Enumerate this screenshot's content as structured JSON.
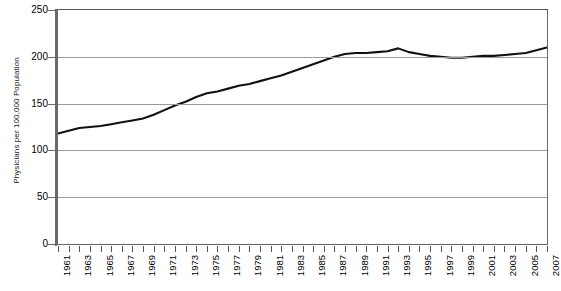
{
  "chart_data": {
    "type": "line",
    "title": "",
    "xlabel": "",
    "ylabel": "Physicians per 100,000 Population",
    "ylim": [
      0,
      250
    ],
    "yticks": [
      0,
      50,
      100,
      150,
      200,
      250
    ],
    "xlim": [
      1961,
      2007
    ],
    "grid": true,
    "legend": false,
    "line_color": "#111111",
    "grid_color": "#9a9a9a",
    "axis_color": "#666666",
    "xtick_labels": [
      "1961",
      "1963",
      "1965",
      "1967",
      "1969",
      "1971",
      "1973",
      "1975",
      "1977",
      "1979",
      "1981",
      "1983",
      "1985",
      "1987",
      "1989",
      "1991",
      "1993",
      "1995",
      "1997",
      "1999",
      "2001",
      "2003",
      "2005",
      "2007"
    ],
    "x": [
      1961,
      1962,
      1963,
      1964,
      1965,
      1966,
      1967,
      1968,
      1969,
      1970,
      1971,
      1972,
      1973,
      1974,
      1975,
      1976,
      1977,
      1978,
      1979,
      1980,
      1981,
      1982,
      1983,
      1984,
      1985,
      1986,
      1987,
      1988,
      1989,
      1990,
      1991,
      1992,
      1993,
      1994,
      1995,
      1996,
      1997,
      1998,
      1999,
      2000,
      2001,
      2002,
      2003,
      2004,
      2005,
      2006,
      2007
    ],
    "values": [
      118,
      121,
      124,
      125,
      126,
      128,
      130,
      132,
      134,
      138,
      143,
      148,
      152,
      157,
      161,
      163,
      166,
      169,
      171,
      174,
      177,
      180,
      184,
      188,
      192,
      196,
      200,
      203,
      204,
      204,
      205,
      206,
      209,
      205,
      203,
      201,
      200,
      199,
      199,
      200,
      201,
      201,
      202,
      203,
      204,
      207,
      210
    ],
    "series": [
      {
        "name": "Physicians per 100,000 Population",
        "values": [
          118,
          121,
          124,
          125,
          126,
          128,
          130,
          132,
          134,
          138,
          143,
          148,
          152,
          157,
          161,
          163,
          166,
          169,
          171,
          174,
          177,
          180,
          184,
          188,
          192,
          196,
          200,
          203,
          204,
          204,
          205,
          206,
          209,
          205,
          203,
          201,
          200,
          199,
          199,
          200,
          201,
          201,
          202,
          203,
          204,
          207,
          210
        ]
      }
    ]
  }
}
